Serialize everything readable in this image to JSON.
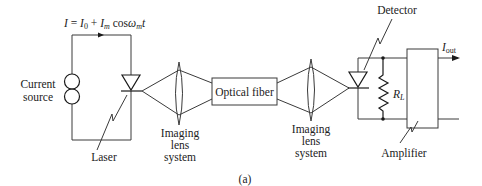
{
  "diagram": {
    "type": "optical-fiber-communication-link",
    "equation": {
      "I": "I",
      "eq": " = ",
      "I0_base": "I",
      "I0_sub": "0",
      "plus": " + ",
      "Im_base": "I",
      "Im_sub": "m",
      "cos": " cos",
      "omega": "ω",
      "omega_sub": "m",
      "t": "t"
    },
    "labels": {
      "current_source_line1": "Current",
      "current_source_line2": "source",
      "laser": "Laser",
      "lens1_line1": "Imaging",
      "lens1_line2": "lens",
      "lens1_line3": "system",
      "optical_fiber": "Optical fiber",
      "lens2_line1": "Imaging",
      "lens2_line2": "lens",
      "lens2_line3": "system",
      "detector": "Detector",
      "load_resistor_base": "R",
      "load_resistor_sub": "L",
      "amplifier": "Amplifier",
      "output_base": "I",
      "output_sub": "out",
      "caption": "(a)"
    },
    "components": [
      "current-source",
      "laser-diode",
      "imaging-lens-system",
      "optical-fiber",
      "imaging-lens-system",
      "photodetector-diode",
      "load-resistor",
      "amplifier"
    ],
    "colors": {
      "line": "#3a3a3a",
      "text": "#222222",
      "background": "#ffffff"
    }
  }
}
